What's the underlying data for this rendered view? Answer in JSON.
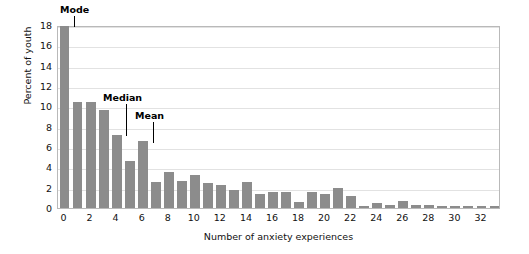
{
  "chart_data": {
    "type": "bar",
    "title": "",
    "xlabel": "Number of anxiety experiences",
    "ylabel": "Percent of youth",
    "xlim": [
      -0.5,
      33.5
    ],
    "ylim": [
      0,
      18
    ],
    "grid": true,
    "legend_position": "none",
    "bar_color": "#8c8c8c",
    "gridline_color": "#e2e2e2",
    "axis_color": "#b9b9b9",
    "text_color": "#111111",
    "categories": [
      0,
      1,
      2,
      3,
      4,
      5,
      6,
      7,
      8,
      9,
      10,
      11,
      12,
      13,
      14,
      15,
      16,
      17,
      18,
      19,
      20,
      21,
      22,
      23,
      24,
      25,
      26,
      27,
      28,
      29,
      30,
      31,
      32,
      33
    ],
    "values": [
      17.9,
      10.4,
      10.4,
      9.6,
      7.2,
      4.6,
      6.6,
      2.6,
      3.55,
      2.7,
      3.25,
      2.45,
      2.3,
      1.75,
      2.55,
      1.35,
      1.55,
      1.6,
      0.55,
      1.6,
      1.4,
      1.95,
      1.2,
      0.2,
      0.5,
      0.25,
      0.65,
      0.3,
      0.25,
      0.2,
      0.2,
      0.15,
      0.15,
      0.15
    ],
    "ytick_labels": [
      "0",
      "2",
      "4",
      "6",
      "8",
      "10",
      "12",
      "14",
      "16",
      "18"
    ],
    "ytick_values": [
      0,
      2,
      4,
      6,
      8,
      10,
      12,
      14,
      16,
      18
    ],
    "xtick_labels": [
      "0",
      "2",
      "4",
      "6",
      "8",
      "10",
      "12",
      "14",
      "16",
      "18",
      "20",
      "22",
      "24",
      "26",
      "28",
      "30",
      "32"
    ],
    "xtick_values": [
      0,
      2,
      4,
      6,
      8,
      10,
      12,
      14,
      16,
      18,
      20,
      22,
      24,
      26,
      28,
      30,
      32
    ],
    "annotations": [
      {
        "label": "Mode",
        "category": 0,
        "text_x": 60,
        "text_y": 4,
        "line_x": 74,
        "line_top": 16,
        "line_bottom": 27
      },
      {
        "label": "Median",
        "category": 4,
        "text_x": 103,
        "text_y": 92,
        "line_x": 126,
        "line_top": 104,
        "line_bottom": 136
      },
      {
        "label": "Mean",
        "category": 6,
        "text_x": 135,
        "text_y": 110,
        "line_x": 153,
        "line_top": 122,
        "line_bottom": 143
      }
    ]
  }
}
